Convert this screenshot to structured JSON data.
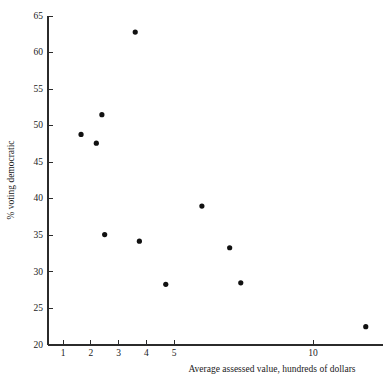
{
  "chart_data": {
    "type": "scatter",
    "title": "",
    "xlabel": "Average assessed value, hundreds of dollars",
    "ylabel": "% voting democratic",
    "xlim": [
      0.55,
      12.6
    ],
    "ylim": [
      20,
      65
    ],
    "grid": false,
    "legend": "none",
    "xticks": [
      1,
      2,
      3,
      4,
      5,
      10
    ],
    "xtick_labels": [
      "1",
      "2",
      "3",
      "4",
      "5",
      "10"
    ],
    "yticks": [
      20,
      25,
      30,
      35,
      40,
      45,
      50,
      55,
      60,
      65
    ],
    "ytick_labels": [
      "20",
      "25",
      "30",
      "35",
      "40",
      "45",
      "50",
      "55",
      "60",
      "65"
    ],
    "tick_direction": "in",
    "marker": "filled-circle",
    "marker_color": "#111111",
    "points": [
      {
        "x": 1.65,
        "y": 48.8
      },
      {
        "x": 2.2,
        "y": 47.6
      },
      {
        "x": 2.4,
        "y": 51.5
      },
      {
        "x": 2.5,
        "y": 35.1
      },
      {
        "x": 3.6,
        "y": 62.8
      },
      {
        "x": 3.75,
        "y": 34.2
      },
      {
        "x": 4.7,
        "y": 28.3
      },
      {
        "x": 6.0,
        "y": 39.0
      },
      {
        "x": 7.0,
        "y": 33.3
      },
      {
        "x": 7.4,
        "y": 28.5
      },
      {
        "x": 11.9,
        "y": 22.5
      }
    ]
  },
  "axis": {
    "x_title": "Average assessed value, hundreds of dollars",
    "y_title": "% voting democratic"
  },
  "ticks": {
    "y": [
      "65",
      "60",
      "55",
      "50",
      "45",
      "40",
      "35",
      "30",
      "25",
      "20"
    ],
    "x": [
      "1",
      "2",
      "3",
      "4",
      "5",
      "10"
    ]
  },
  "colors": {
    "axis": "#2b2b2b",
    "marker": "#111111",
    "background": "#ffffff",
    "text": "#1a1a1a"
  }
}
